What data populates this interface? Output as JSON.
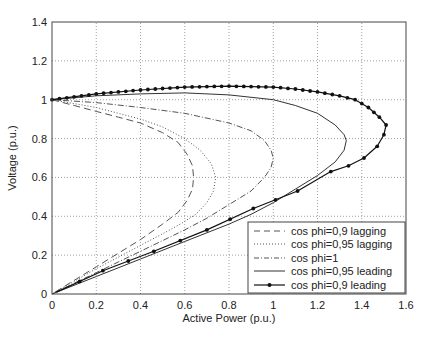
{
  "chart_data": {
    "type": "line",
    "title": "",
    "xlabel": "Active Power (p.u.)",
    "ylabel": "Voltage (p.u.)",
    "xlim": [
      0,
      1.6
    ],
    "ylim": [
      0,
      1.4
    ],
    "xticks": [
      "0",
      "0.2",
      "0.4",
      "0.6",
      "0.8",
      "1",
      "1.2",
      "1.4",
      "1.6"
    ],
    "yticks": [
      "0",
      "0.2",
      "0.4",
      "0.6",
      "0.8",
      "1",
      "1.2",
      "1.4"
    ],
    "grid": true,
    "legend_position": "lower right",
    "series": [
      {
        "name": "cos phi=0,9 lagging",
        "style": "dashed",
        "points": [
          [
            0,
            1.0
          ],
          [
            0.1,
            0.97
          ],
          [
            0.2,
            0.94
          ],
          [
            0.3,
            0.91
          ],
          [
            0.4,
            0.88
          ],
          [
            0.5,
            0.83
          ],
          [
            0.57,
            0.78
          ],
          [
            0.61,
            0.72
          ],
          [
            0.635,
            0.66
          ],
          [
            0.64,
            0.6
          ],
          [
            0.635,
            0.54
          ],
          [
            0.61,
            0.48
          ],
          [
            0.57,
            0.42
          ],
          [
            0.5,
            0.36
          ],
          [
            0.4,
            0.28
          ],
          [
            0.3,
            0.21
          ],
          [
            0.2,
            0.14
          ],
          [
            0.1,
            0.07
          ],
          [
            0,
            0
          ]
        ]
      },
      {
        "name": "cos phi=0,95 lagging",
        "style": "dotted",
        "points": [
          [
            0,
            1.0
          ],
          [
            0.1,
            0.98
          ],
          [
            0.2,
            0.96
          ],
          [
            0.3,
            0.93
          ],
          [
            0.4,
            0.9
          ],
          [
            0.5,
            0.86
          ],
          [
            0.6,
            0.8
          ],
          [
            0.67,
            0.74
          ],
          [
            0.72,
            0.67
          ],
          [
            0.74,
            0.6
          ],
          [
            0.73,
            0.53
          ],
          [
            0.7,
            0.47
          ],
          [
            0.65,
            0.41
          ],
          [
            0.58,
            0.36
          ],
          [
            0.5,
            0.31
          ],
          [
            0.4,
            0.25
          ],
          [
            0.3,
            0.19
          ],
          [
            0.2,
            0.13
          ],
          [
            0.1,
            0.065
          ],
          [
            0,
            0
          ]
        ]
      },
      {
        "name": "cos phi=1",
        "style": "dashdot",
        "points": [
          [
            0,
            1.0
          ],
          [
            0.2,
            0.985
          ],
          [
            0.4,
            0.96
          ],
          [
            0.6,
            0.93
          ],
          [
            0.8,
            0.88
          ],
          [
            0.9,
            0.84
          ],
          [
            0.96,
            0.79
          ],
          [
            0.99,
            0.74
          ],
          [
            1.0,
            0.7
          ],
          [
            0.99,
            0.65
          ],
          [
            0.96,
            0.6
          ],
          [
            0.9,
            0.53
          ],
          [
            0.8,
            0.46
          ],
          [
            0.7,
            0.39
          ],
          [
            0.6,
            0.33
          ],
          [
            0.4,
            0.22
          ],
          [
            0.2,
            0.11
          ],
          [
            0,
            0
          ]
        ]
      },
      {
        "name": "cos phi=0,95 leading",
        "style": "solid",
        "points": [
          [
            0,
            1.0
          ],
          [
            0.2,
            1.02
          ],
          [
            0.4,
            1.03
          ],
          [
            0.6,
            1.035
          ],
          [
            0.8,
            1.025
          ],
          [
            1.0,
            1.0
          ],
          [
            1.1,
            0.97
          ],
          [
            1.2,
            0.93
          ],
          [
            1.28,
            0.87
          ],
          [
            1.32,
            0.82
          ],
          [
            1.33,
            0.79
          ],
          [
            1.32,
            0.74
          ],
          [
            1.28,
            0.68
          ],
          [
            1.2,
            0.61
          ],
          [
            1.1,
            0.54
          ],
          [
            1.0,
            0.47
          ],
          [
            0.9,
            0.41
          ],
          [
            0.8,
            0.36
          ],
          [
            0.6,
            0.27
          ],
          [
            0.4,
            0.18
          ],
          [
            0.2,
            0.09
          ],
          [
            0,
            0
          ]
        ]
      },
      {
        "name": "cos phi=0,9 leading",
        "style": "solid-marker",
        "points": [
          [
            0,
            1.0
          ],
          [
            0.2,
            1.03
          ],
          [
            0.4,
            1.05
          ],
          [
            0.6,
            1.065
          ],
          [
            0.8,
            1.07
          ],
          [
            1.0,
            1.065
          ],
          [
            1.1,
            1.055
          ],
          [
            1.2,
            1.04
          ],
          [
            1.3,
            1.02
          ],
          [
            1.37,
            1.0
          ],
          [
            1.43,
            0.96
          ],
          [
            1.48,
            0.91
          ],
          [
            1.51,
            0.87
          ],
          [
            1.5,
            0.82
          ],
          [
            1.47,
            0.76
          ],
          [
            1.41,
            0.7
          ],
          [
            1.34,
            0.66
          ],
          [
            1.26,
            0.63
          ],
          [
            1.11,
            0.53
          ],
          [
            0.91,
            0.44
          ],
          [
            0.7,
            0.33
          ],
          [
            0.46,
            0.22
          ],
          [
            0.23,
            0.12
          ],
          [
            0.02,
            0.01
          ]
        ]
      }
    ]
  },
  "legend": {
    "items": [
      {
        "label": "cos phi=0,9 lagging"
      },
      {
        "label": "cos phi=0,95 lagging"
      },
      {
        "label": "cos phi=1"
      },
      {
        "label": "cos phi=0,95 leading"
      },
      {
        "label": "cos phi=0,9 leading"
      }
    ]
  }
}
